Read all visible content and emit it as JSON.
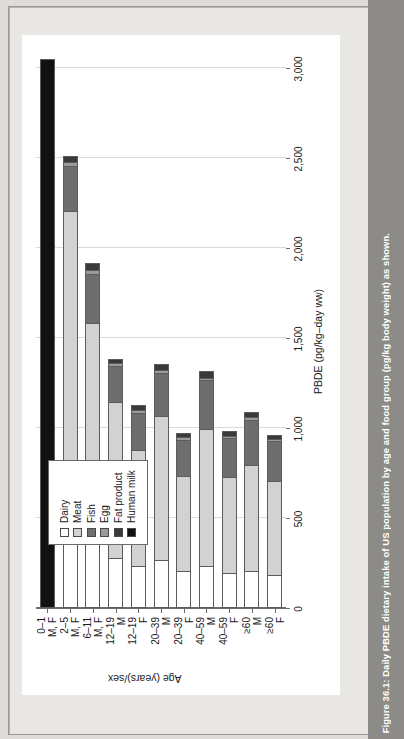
{
  "caption": {
    "text": "Figure 36.1: Daily PBDE dietary intake of US population by age and food group (pg/kg body weight) as shown."
  },
  "legend": {
    "items": [
      {
        "label": "Dairy",
        "color": "#ffffff"
      },
      {
        "label": "Meat",
        "color": "#d2d2d2"
      },
      {
        "label": "Fish",
        "color": "#6e6e6e"
      },
      {
        "label": "Egg",
        "color": "#9b9b9b"
      },
      {
        "label": "Fat product",
        "color": "#3a3a3a"
      },
      {
        "label": "Human milk",
        "color": "#111111"
      }
    ]
  },
  "chart_data": {
    "type": "bar",
    "orientation": "horizontal",
    "stacked": true,
    "title": "",
    "xlabel": "Age (years)/sex",
    "ylabel": "PBDE (pg/kg–day ww)",
    "ylim": [
      0,
      3000
    ],
    "yticks": [
      0,
      500,
      1000,
      1500,
      2000,
      2500,
      3000
    ],
    "ytick_labels": [
      "0",
      "500",
      "1,000",
      "1,500",
      "2,000",
      "2,500",
      "3,000"
    ],
    "grid": true,
    "legend_position": "upper-left",
    "categories": [
      {
        "age": "0–1",
        "sex": "M, F"
      },
      {
        "age": "2–5",
        "sex": "M, F"
      },
      {
        "age": "6–11",
        "sex": "M, F"
      },
      {
        "age": "12–19",
        "sex": "M"
      },
      {
        "age": "12–19",
        "sex": "F"
      },
      {
        "age": "20–39",
        "sex": "M"
      },
      {
        "age": "20–39",
        "sex": "F"
      },
      {
        "age": "40–59",
        "sex": "M"
      },
      {
        "age": "40–59",
        "sex": "F"
      },
      {
        "age": "≥60",
        "sex": "M"
      },
      {
        "age": "≥60",
        "sex": "F"
      }
    ],
    "series": [
      {
        "name": "Dairy",
        "color": "#ffffff",
        "values": [
          0,
          540,
          420,
          270,
          230,
          260,
          200,
          230,
          190,
          200,
          180
        ]
      },
      {
        "name": "Meat",
        "color": "#d2d2d2",
        "values": [
          0,
          1660,
          1160,
          870,
          640,
          800,
          530,
          760,
          530,
          590,
          520
        ]
      },
      {
        "name": "Fish",
        "color": "#6e6e6e",
        "values": [
          0,
          250,
          270,
          200,
          210,
          240,
          200,
          270,
          220,
          250,
          220
        ]
      },
      {
        "name": "Egg",
        "color": "#9b9b9b",
        "values": [
          0,
          20,
          20,
          15,
          15,
          15,
          12,
          15,
          12,
          15,
          12
        ]
      },
      {
        "name": "Fat product",
        "color": "#3a3a3a",
        "values": [
          0,
          40,
          45,
          30,
          35,
          40,
          30,
          40,
          30,
          35,
          30
        ]
      },
      {
        "name": "Human milk",
        "color": "#111111",
        "values": [
          3050,
          0,
          0,
          0,
          0,
          0,
          0,
          0,
          0,
          0,
          0
        ]
      }
    ],
    "totals": [
      3050,
      2510,
      1915,
      1385,
      1130,
      1355,
      972,
      1315,
      982,
      1090,
      962
    ]
  }
}
